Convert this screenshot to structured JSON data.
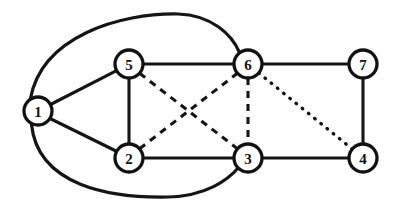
{
  "figure": {
    "background_color": "#fefefe",
    "stroke_color": "#151515",
    "node_fill_color": "#ffffff",
    "width": 395,
    "height": 203
  },
  "nodes": [
    {
      "id": "1",
      "label": "1",
      "x": 38,
      "y": 111,
      "r": 14
    },
    {
      "id": "2",
      "label": "2",
      "x": 129,
      "y": 158,
      "r": 14
    },
    {
      "id": "3",
      "label": "3",
      "x": 248,
      "y": 158,
      "r": 14
    },
    {
      "id": "4",
      "label": "4",
      "x": 363,
      "y": 158,
      "r": 14
    },
    {
      "id": "5",
      "label": "5",
      "x": 129,
      "y": 64,
      "r": 14
    },
    {
      "id": "6",
      "label": "6",
      "x": 248,
      "y": 64,
      "r": 14
    },
    {
      "id": "7",
      "label": "7",
      "x": 363,
      "y": 64,
      "r": 14
    }
  ],
  "edges": [
    {
      "from": "1",
      "to": "5",
      "style": "solid",
      "shape": "straight"
    },
    {
      "from": "1",
      "to": "2",
      "style": "solid",
      "shape": "straight"
    },
    {
      "from": "5",
      "to": "2",
      "style": "solid",
      "shape": "straight"
    },
    {
      "from": "5",
      "to": "6",
      "style": "solid",
      "shape": "straight"
    },
    {
      "from": "2",
      "to": "3",
      "style": "solid",
      "shape": "straight"
    },
    {
      "from": "6",
      "to": "7",
      "style": "solid",
      "shape": "straight"
    },
    {
      "from": "3",
      "to": "4",
      "style": "solid",
      "shape": "straight"
    },
    {
      "from": "7",
      "to": "4",
      "style": "solid",
      "shape": "straight"
    },
    {
      "from": "1",
      "to": "6",
      "style": "solid",
      "shape": "curved-above"
    },
    {
      "from": "1",
      "to": "3",
      "style": "solid",
      "shape": "curved-below"
    },
    {
      "from": "5",
      "to": "3",
      "style": "dashed",
      "shape": "straight"
    },
    {
      "from": "2",
      "to": "6",
      "style": "dashed",
      "shape": "straight"
    },
    {
      "from": "6",
      "to": "3",
      "style": "dashed",
      "shape": "straight"
    },
    {
      "from": "6",
      "to": "4",
      "style": "dotted",
      "shape": "straight"
    }
  ],
  "edge_paths": {
    "e_1_5": "M 50.5 104.5 L 117.5 70.2",
    "e_1_2": "M 50.0 118.5 L 117.0 151.5",
    "e_5_2": "M 129 78 L 129 144",
    "e_5_6": "M 143 64 L 234 64",
    "e_2_3": "M 143 158 L 234 158",
    "e_6_7": "M 262 64 L 349 64",
    "e_3_4": "M 262 158 L 349 158",
    "e_7_4": "M 363 78 L 363 144",
    "e_1_6": "M 30.5 98.5 C 42 36 120 13 178 14 C 212 15 232 35 239.5 52.5",
    "e_1_3": "M 31.5 124.5 C 38 186 110 198 168 197 C 206 196 228 180 238.5 167.5",
    "e_5_3": "M 139.6 73.3 L 237.4 148.7",
    "e_2_6": "M 139.6 148.7 L 237.4 73.3",
    "e_6_3": "M 248 78 L 248 144",
    "e_6_4": "M 258.8 73.0 L 352.2 149.0"
  }
}
